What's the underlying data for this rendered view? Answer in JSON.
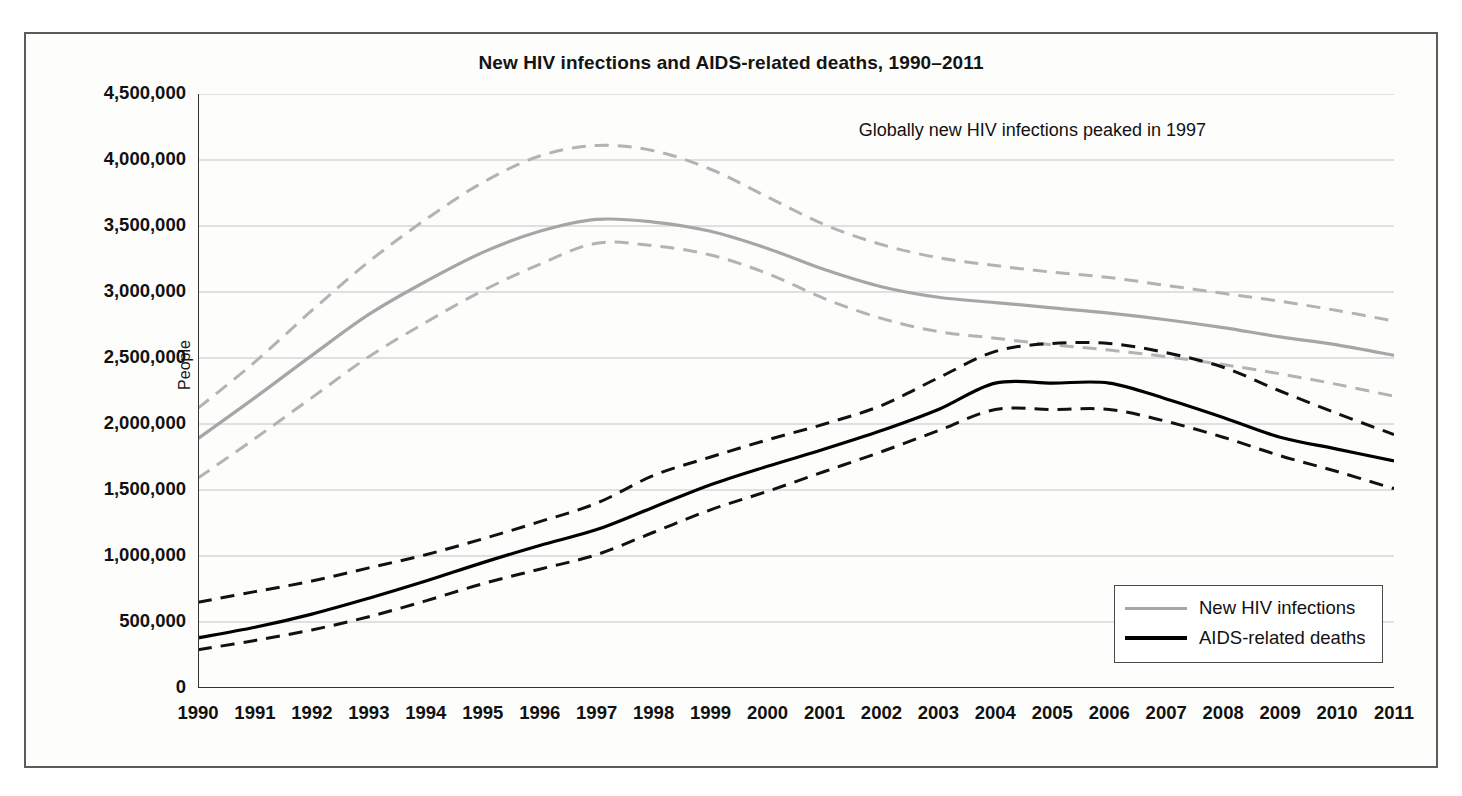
{
  "figure": {
    "title": "New HIV infections and AIDS-related deaths, 1990–2011",
    "annotation": "Globally new HIV infections peaked in 1997"
  },
  "legend": {
    "items": [
      {
        "label": "New HIV infections",
        "color": "#a6a6a6"
      },
      {
        "label": "AIDS-related deaths",
        "color": "#000000"
      }
    ]
  },
  "chart_data": {
    "type": "line",
    "title": "New HIV infections and AIDS-related deaths, 1990–2011",
    "xlabel": "",
    "ylabel": "People",
    "annotations": [
      "Globally new HIV infections peaked in 1997"
    ],
    "grid": "horizontal",
    "legend_position": "bottom-right",
    "xlim": [
      1990,
      2011
    ],
    "ylim": [
      0,
      4500000
    ],
    "ytick_interval": 500000,
    "categories": [
      1990,
      1991,
      1992,
      1993,
      1994,
      1995,
      1996,
      1997,
      1998,
      1999,
      2000,
      2001,
      2002,
      2003,
      2004,
      2005,
      2006,
      2007,
      2008,
      2009,
      2010,
      2011
    ],
    "xtick_labels": [
      "1990",
      "1991",
      "1992",
      "1993",
      "1994",
      "1995",
      "1996",
      "1997",
      "1998",
      "1999",
      "2000",
      "2001",
      "2002",
      "2003",
      "2004",
      "2005",
      "2006",
      "2007",
      "2008",
      "2009",
      "2010",
      "2011"
    ],
    "ytick_labels": [
      "0",
      "500,000",
      "1,000,000",
      "1,500,000",
      "2,000,000",
      "2,500,000",
      "3,000,000",
      "3,500,000",
      "4,000,000",
      "4,500,000"
    ],
    "ytick_values": [
      0,
      500000,
      1000000,
      1500000,
      2000000,
      2500000,
      3000000,
      3500000,
      4000000,
      4500000
    ],
    "series": [
      {
        "name": "New HIV infections",
        "color": "#a6a6a6",
        "style": "solid",
        "values": [
          1890000,
          2200000,
          2520000,
          2830000,
          3080000,
          3300000,
          3460000,
          3550000,
          3530000,
          3460000,
          3330000,
          3170000,
          3040000,
          2960000,
          2920000,
          2880000,
          2840000,
          2790000,
          2730000,
          2660000,
          2600000,
          2520000
        ]
      },
      {
        "name": "New HIV infections upper bound",
        "color": "#b3b3b3",
        "style": "dashed",
        "values": [
          2120000,
          2470000,
          2860000,
          3230000,
          3550000,
          3830000,
          4030000,
          4110000,
          4070000,
          3930000,
          3720000,
          3510000,
          3360000,
          3260000,
          3200000,
          3150000,
          3110000,
          3050000,
          2990000,
          2930000,
          2860000,
          2780000
        ]
      },
      {
        "name": "New HIV infections lower bound",
        "color": "#b3b3b3",
        "style": "dashed",
        "values": [
          1590000,
          1890000,
          2200000,
          2510000,
          2770000,
          3010000,
          3210000,
          3370000,
          3350000,
          3280000,
          3140000,
          2950000,
          2800000,
          2700000,
          2650000,
          2600000,
          2560000,
          2510000,
          2450000,
          2380000,
          2300000,
          2210000
        ]
      },
      {
        "name": "AIDS-related deaths",
        "color": "#000000",
        "style": "solid",
        "values": [
          380000,
          460000,
          560000,
          680000,
          810000,
          950000,
          1080000,
          1200000,
          1370000,
          1540000,
          1680000,
          1810000,
          1950000,
          2110000,
          2310000,
          2310000,
          2310000,
          2190000,
          2050000,
          1900000,
          1810000,
          1720000
        ]
      },
      {
        "name": "AIDS-related deaths upper bound",
        "color": "#111111",
        "style": "dashed",
        "values": [
          650000,
          730000,
          810000,
          910000,
          1010000,
          1130000,
          1260000,
          1400000,
          1610000,
          1750000,
          1880000,
          2000000,
          2140000,
          2350000,
          2550000,
          2610000,
          2610000,
          2540000,
          2430000,
          2250000,
          2080000,
          1920000
        ]
      },
      {
        "name": "AIDS-related deaths lower bound",
        "color": "#111111",
        "style": "dashed",
        "values": [
          290000,
          360000,
          440000,
          540000,
          660000,
          790000,
          900000,
          1010000,
          1180000,
          1350000,
          1490000,
          1640000,
          1790000,
          1950000,
          2110000,
          2110000,
          2110000,
          2020000,
          1900000,
          1760000,
          1640000,
          1510000
        ]
      }
    ]
  }
}
